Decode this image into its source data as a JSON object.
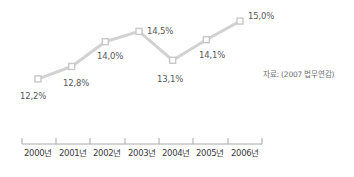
{
  "chart_data": {
    "type": "line",
    "title": "",
    "xlabel": "",
    "ylabel": "",
    "categories": [
      "2000년",
      "2001년",
      "2002년",
      "2003년",
      "2004년",
      "2005년",
      "2006년"
    ],
    "values": [
      12.2,
      12.8,
      14.0,
      14.5,
      13.1,
      14.1,
      15.0
    ],
    "point_labels": [
      "12,2%",
      "12,8%",
      "14,0%",
      "14,5%",
      "13,1%",
      "14,1%",
      "15,0%"
    ],
    "series": [
      {
        "name": "",
        "values": [
          12.2,
          12.8,
          14.0,
          14.5,
          13.1,
          14.1,
          15.0
        ]
      }
    ],
    "ylim": [
      12.0,
      15.2
    ],
    "grid": false,
    "legend": "none",
    "marker": "square",
    "line_color": "#d2d2d2",
    "marker_fill": "#ffffff",
    "marker_stroke": "#c8c8c8",
    "label_color": "#58585a",
    "axis_color": "#9a9a9a"
  },
  "source": {
    "note": "자료: (2007 법무연감)"
  },
  "axis": {
    "tick_labels": [
      "2000년",
      "2001년",
      "2002년",
      "2003년",
      "2004년",
      "2005년",
      "2006년"
    ]
  }
}
